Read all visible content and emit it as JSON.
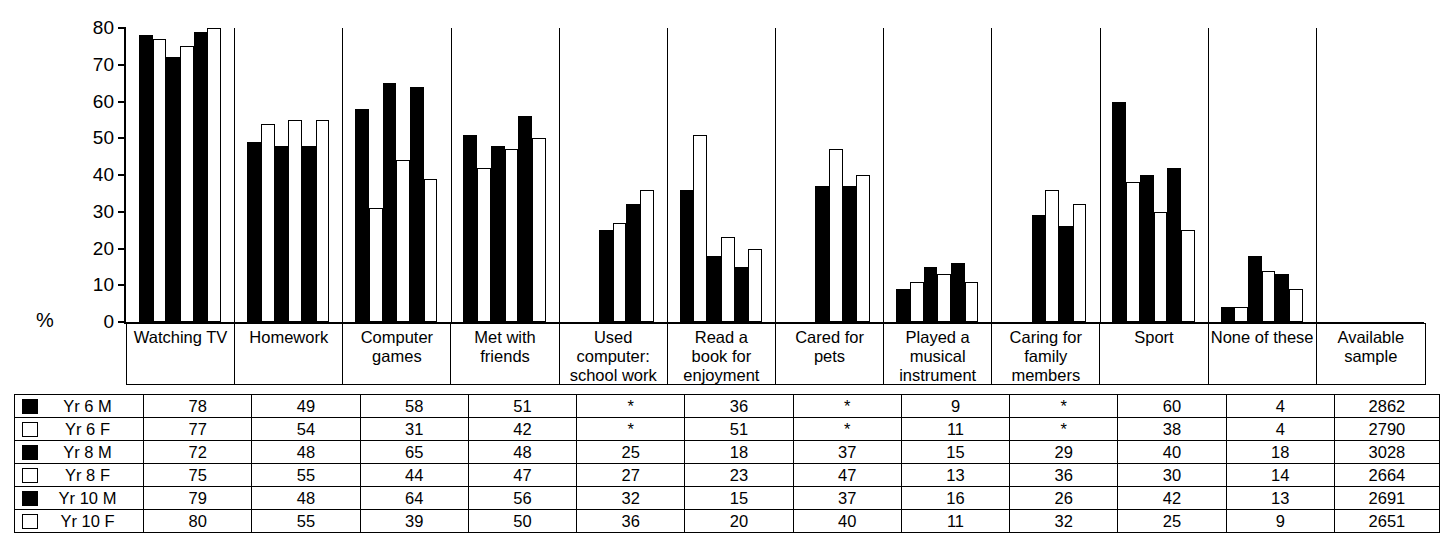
{
  "chart_data": {
    "type": "bar",
    "title": "",
    "xlabel": "",
    "ylabel": "%",
    "ylim": [
      0,
      80
    ],
    "yticks": [
      "0",
      "10",
      "20",
      "30",
      "40",
      "50",
      "60",
      "70",
      "80"
    ],
    "grid": false,
    "legend_position": "table-left-column",
    "missing_marker": "*",
    "categories": [
      "Watching TV",
      "Homework",
      "Computer games",
      "Met with friends",
      "Used computer: school work",
      "Read a book for enjoyment",
      "Cared for pets",
      "Played a musical instrument",
      "Caring for family members",
      "Sport",
      "None of these"
    ],
    "series": [
      {
        "name": "Yr 6 M",
        "fill": "black",
        "values": [
          78,
          49,
          58,
          51,
          null,
          36,
          null,
          9,
          null,
          60,
          4
        ]
      },
      {
        "name": "Yr 6 F",
        "fill": "white",
        "values": [
          77,
          54,
          31,
          42,
          null,
          51,
          null,
          11,
          null,
          38,
          4
        ]
      },
      {
        "name": "Yr 8 M",
        "fill": "black",
        "values": [
          72,
          48,
          65,
          48,
          25,
          18,
          37,
          15,
          29,
          40,
          18
        ]
      },
      {
        "name": "Yr 8 F",
        "fill": "white",
        "values": [
          75,
          55,
          44,
          47,
          27,
          23,
          47,
          13,
          36,
          30,
          14
        ]
      },
      {
        "name": "Yr 10 M",
        "fill": "black",
        "values": [
          79,
          48,
          64,
          56,
          32,
          15,
          37,
          16,
          26,
          42,
          13
        ]
      },
      {
        "name": "Yr 10 F",
        "fill": "white",
        "values": [
          80,
          55,
          39,
          50,
          36,
          20,
          40,
          11,
          32,
          25,
          9
        ]
      }
    ]
  },
  "axis": {
    "percent_symbol": "%",
    "zero_label": "0"
  },
  "category_headers": [
    {
      "lines": [
        "Watching TV"
      ]
    },
    {
      "lines": [
        "Homework"
      ]
    },
    {
      "lines": [
        "Computer",
        "games"
      ]
    },
    {
      "lines": [
        "Met with",
        "friends"
      ]
    },
    {
      "lines": [
        "Used",
        "computer:",
        "school work"
      ]
    },
    {
      "lines": [
        "Read a",
        "book for",
        "enjoyment"
      ]
    },
    {
      "lines": [
        "Cared for",
        "pets"
      ]
    },
    {
      "lines": [
        "Played a",
        "musical",
        "instrument"
      ]
    },
    {
      "lines": [
        "Caring for",
        "family",
        "members"
      ]
    },
    {
      "lines": [
        "Sport"
      ]
    },
    {
      "lines": [
        "None of these"
      ]
    },
    {
      "lines": [
        "Available",
        "sample"
      ]
    }
  ],
  "table": {
    "columns": [
      "",
      "Watching TV",
      "Homework",
      "Computer games",
      "Met with friends",
      "Used computer: school work",
      "Read a book for enjoyment",
      "Cared for pets",
      "Played a musical instrument",
      "Caring for family members",
      "Sport",
      "None of these",
      "Available sample"
    ],
    "rows": [
      {
        "swatch": "black",
        "label": "Yr 6 M",
        "cells": [
          "78",
          "49",
          "58",
          "51",
          "*",
          "36",
          "*",
          "9",
          "*",
          "60",
          "4",
          "2862"
        ]
      },
      {
        "swatch": "white",
        "label": "Yr 6 F",
        "cells": [
          "77",
          "54",
          "31",
          "42",
          "*",
          "51",
          "*",
          "11",
          "*",
          "38",
          "4",
          "2790"
        ]
      },
      {
        "swatch": "black",
        "label": "Yr 8 M",
        "cells": [
          "72",
          "48",
          "65",
          "48",
          "25",
          "18",
          "37",
          "15",
          "29",
          "40",
          "18",
          "3028"
        ]
      },
      {
        "swatch": "white",
        "label": "Yr 8 F",
        "cells": [
          "75",
          "55",
          "44",
          "47",
          "27",
          "23",
          "47",
          "13",
          "36",
          "30",
          "14",
          "2664"
        ]
      },
      {
        "swatch": "black",
        "label": "Yr 10 M",
        "cells": [
          "79",
          "48",
          "64",
          "56",
          "32",
          "15",
          "37",
          "16",
          "26",
          "42",
          "13",
          "2691"
        ]
      },
      {
        "swatch": "white",
        "label": "Yr 10 F",
        "cells": [
          "80",
          "55",
          "39",
          "50",
          "36",
          "20",
          "40",
          "11",
          "32",
          "25",
          "9",
          "2651"
        ]
      }
    ]
  },
  "colors": {
    "male_fill": "#000000",
    "female_fill": "#ffffff",
    "outline": "#000000",
    "background": "#ffffff"
  }
}
